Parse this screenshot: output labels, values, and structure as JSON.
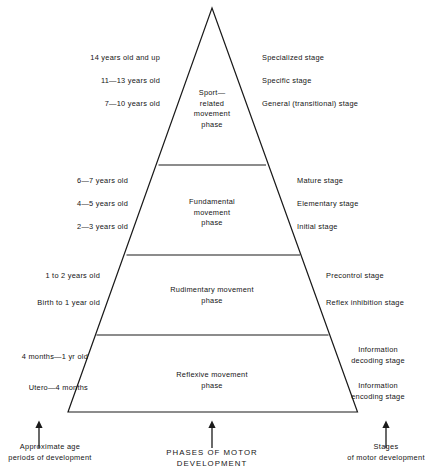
{
  "figure": {
    "title_caption_center": "PHASES OF MOTOR DEVELOPMENT",
    "caption_left_line1": "Approximate age",
    "caption_left_line2": "periods of development",
    "caption_right_line1": "Stages",
    "caption_right_line2": "of motor development",
    "stroke_color": "#1a1a1a",
    "text_color": "#141414",
    "background_color": "#ffffff"
  },
  "bands": [
    {
      "id": "sport-related",
      "phase_lines": [
        "Sport—",
        "related",
        "movement",
        "phase"
      ],
      "ages": [
        "14 years old and up",
        "11—13 years old",
        "7—10 years old"
      ],
      "stages": [
        "Specialized stage",
        "Specific stage",
        "General (transitional) stage"
      ]
    },
    {
      "id": "fundamental",
      "phase_lines": [
        "Fundamental",
        "movement",
        "phase"
      ],
      "ages": [
        "6—7 years old",
        "4—5 years old",
        "2—3 years old"
      ],
      "stages": [
        "Mature stage",
        "Elementary stage",
        "Initial stage"
      ]
    },
    {
      "id": "rudimentary",
      "phase_lines": [
        "Rudimentary movement",
        "phase"
      ],
      "ages": [
        "1 to 2 years old",
        "Birth to 1 year old"
      ],
      "stages": [
        "Precontrol stage",
        "Reflex inhibition stage"
      ]
    },
    {
      "id": "reflexive",
      "phase_lines": [
        "Reflexive movement",
        "phase"
      ],
      "ages": [
        "4 months—1 yr old",
        "Utero—4 months"
      ],
      "stages": [
        "Information decoding stage",
        "Information encoding stage"
      ]
    }
  ],
  "stages_split": {
    "info_decoding_l1": "Information",
    "info_decoding_l2": "decoding stage",
    "info_encoding_l1": "Information",
    "info_encoding_l2": "encoding stage"
  }
}
